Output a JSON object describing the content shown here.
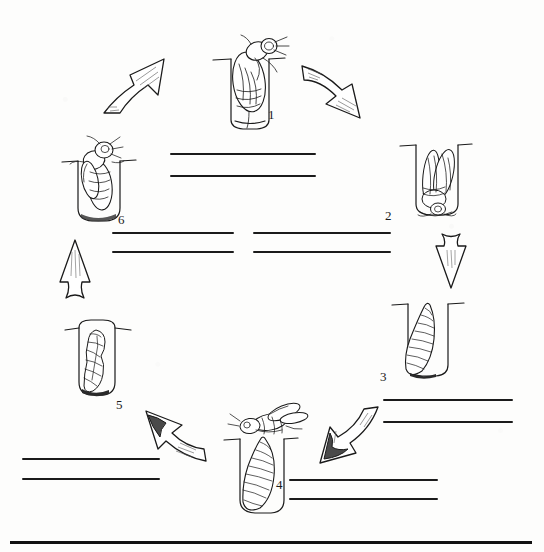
{
  "worksheet": {
    "title": "Honey Bee Life Cycle Diagram",
    "background_color": "#fdfdfc",
    "ink_color": "#1a1a1a"
  },
  "frame": {
    "bottom_rule": {
      "x": 10,
      "y": 541,
      "width": 522,
      "height": 3,
      "color": "#111111"
    }
  },
  "stages": [
    {
      "id": "stage-1",
      "number": "1",
      "icon": "bee-emerging-from-cell-icon",
      "description": "Adult bee emerging head-first out of the brood cell",
      "x": 205,
      "y": 24,
      "w": 86,
      "h": 106,
      "num_x": 268,
      "num_y": 107
    },
    {
      "id": "stage-2",
      "number": "2",
      "icon": "bee-laying-egg-in-cell-icon",
      "description": "Adult bee inside the cell, wings folded, depositing egg",
      "x": 398,
      "y": 136,
      "w": 70,
      "h": 86,
      "num_x": 385,
      "num_y": 208
    },
    {
      "id": "stage-3",
      "number": "3",
      "icon": "larva-small-in-cell-icon",
      "description": "Curled larva growing inside the brood cell",
      "x": 390,
      "y": 293,
      "w": 70,
      "h": 88,
      "num_x": 380,
      "num_y": 369
    },
    {
      "id": "stage-4",
      "number": "4",
      "icon": "larva-large-with-nurse-bee-icon",
      "description": "Full-grown larva filling the cell while a nurse bee feeds it",
      "x": 222,
      "y": 400,
      "w": 92,
      "h": 118,
      "num_x": 276,
      "num_y": 477
    },
    {
      "id": "stage-5",
      "number": "5",
      "icon": "pupa-in-capped-cell-icon",
      "description": "Pupa developing inside the sealed cell",
      "x": 63,
      "y": 316,
      "w": 62,
      "h": 82,
      "num_x": 116,
      "num_y": 397
    },
    {
      "id": "stage-6",
      "number": "6",
      "icon": "adult-bee-in-cell-icon",
      "description": "Newly formed adult bee inside the cell ready to emerge",
      "x": 60,
      "y": 134,
      "w": 72,
      "h": 90,
      "num_x": 118,
      "num_y": 212
    }
  ],
  "arrows": [
    {
      "id": "arrow-6-to-1",
      "icon": "curved-arrow-up-right-icon",
      "x": 100,
      "y": 55,
      "w": 70,
      "h": 58,
      "from": "6",
      "to": "1"
    },
    {
      "id": "arrow-1-to-2",
      "icon": "curved-arrow-down-right-icon",
      "x": 300,
      "y": 60,
      "w": 76,
      "h": 58,
      "from": "1",
      "to": "2"
    },
    {
      "id": "arrow-2-to-3",
      "icon": "straight-arrow-down-icon",
      "x": 434,
      "y": 232,
      "w": 32,
      "h": 56,
      "from": "2",
      "to": "3"
    },
    {
      "id": "arrow-3-to-4",
      "icon": "curved-arrow-down-left-icon",
      "x": 306,
      "y": 405,
      "w": 72,
      "h": 58,
      "from": "3",
      "to": "4"
    },
    {
      "id": "arrow-4-to-5",
      "icon": "curved-arrow-up-left-icon",
      "x": 132,
      "y": 405,
      "w": 72,
      "h": 56,
      "from": "4",
      "to": "5"
    },
    {
      "id": "arrow-5-to-6",
      "icon": "straight-arrow-up-icon",
      "x": 58,
      "y": 238,
      "w": 32,
      "h": 62,
      "from": "5",
      "to": "6"
    }
  ],
  "answer_lines": [
    {
      "id": "answer-line-1a",
      "group": "stage-1",
      "x": 170,
      "y": 153,
      "width": 146
    },
    {
      "id": "answer-line-1b",
      "group": "stage-1",
      "x": 170,
      "y": 175,
      "width": 146
    },
    {
      "id": "answer-line-6a",
      "group": "stage-6",
      "x": 112,
      "y": 232,
      "width": 122
    },
    {
      "id": "answer-line-6b",
      "group": "stage-6",
      "x": 112,
      "y": 251,
      "width": 122
    },
    {
      "id": "answer-line-2a",
      "group": "stage-2",
      "x": 253,
      "y": 232,
      "width": 138
    },
    {
      "id": "answer-line-2b",
      "group": "stage-2",
      "x": 253,
      "y": 251,
      "width": 138
    },
    {
      "id": "answer-line-3a",
      "group": "stage-3",
      "x": 383,
      "y": 399,
      "width": 130
    },
    {
      "id": "answer-line-3b",
      "group": "stage-3",
      "x": 383,
      "y": 421,
      "width": 130
    },
    {
      "id": "answer-line-4a",
      "group": "stage-4",
      "x": 289,
      "y": 479,
      "width": 149
    },
    {
      "id": "answer-line-4b",
      "group": "stage-4",
      "x": 289,
      "y": 498,
      "width": 149
    },
    {
      "id": "answer-line-5a",
      "group": "stage-5",
      "x": 22,
      "y": 458,
      "width": 138
    },
    {
      "id": "answer-line-5b",
      "group": "stage-5",
      "x": 22,
      "y": 478,
      "width": 138
    }
  ]
}
